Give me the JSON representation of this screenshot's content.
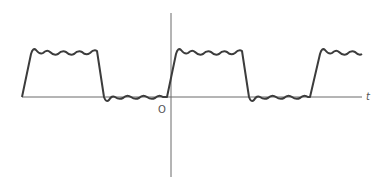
{
  "diagram": {
    "title": "",
    "labels": {
      "origin": "O",
      "x_axis": "t"
    },
    "colors": {
      "axis": "#6b6b6b",
      "waveform": "#3c3c3c",
      "background": "#ffffff"
    }
  }
}
